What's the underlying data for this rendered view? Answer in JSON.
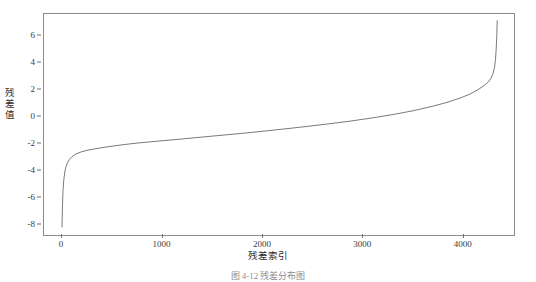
{
  "figure": {
    "caption": "图 4-12  残差分布图"
  },
  "chart_data": {
    "type": "line",
    "title": "",
    "xlabel": "残差索引",
    "ylabel": "残差值",
    "xlim": [
      -180,
      4520
    ],
    "ylim": [
      -8.9,
      7.6
    ],
    "grid": false,
    "legend": null,
    "line_color": "#7a7a7a",
    "xticks": [
      0,
      1000,
      2000,
      3000,
      4000
    ],
    "xtick_labels": [
      "0",
      "1000",
      "2000",
      "3000",
      "4000"
    ],
    "yticks": [
      6,
      4,
      2,
      0,
      -2,
      -4,
      -6,
      -8
    ],
    "ytick_labels": [
      "6",
      "4",
      "2",
      "0",
      "-2",
      "-4",
      "-6",
      "-8"
    ],
    "series": [
      {
        "name": "sorted residuals",
        "x": [
          0,
          5,
          10,
          18,
          28,
          40,
          55,
          75,
          100,
          140,
          190,
          250,
          320,
          400,
          500,
          620,
          760,
          920,
          1100,
          1300,
          1500,
          1700,
          1900,
          2100,
          2300,
          2500,
          2700,
          2900,
          3100,
          3300,
          3500,
          3700,
          3850,
          3980,
          4080,
          4160,
          4220,
          4260,
          4290,
          4310,
          4325,
          4335,
          4342,
          4348,
          4352
        ],
        "y": [
          -8.3,
          -6.6,
          -5.6,
          -4.8,
          -4.2,
          -3.8,
          -3.5,
          -3.25,
          -3.05,
          -2.85,
          -2.7,
          -2.58,
          -2.48,
          -2.38,
          -2.27,
          -2.15,
          -2.03,
          -1.92,
          -1.8,
          -1.66,
          -1.52,
          -1.38,
          -1.24,
          -1.08,
          -0.92,
          -0.75,
          -0.57,
          -0.38,
          -0.16,
          0.08,
          0.36,
          0.7,
          1.0,
          1.32,
          1.62,
          1.95,
          2.25,
          2.5,
          2.8,
          3.15,
          3.6,
          4.2,
          5.0,
          6.0,
          7.1
        ]
      }
    ]
  }
}
